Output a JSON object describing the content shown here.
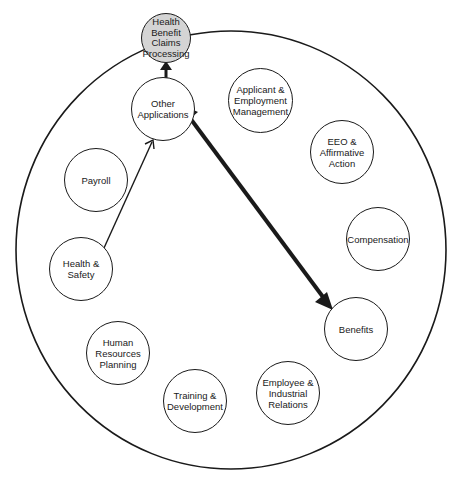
{
  "diagram": {
    "type": "system-integration-circle",
    "colors": {
      "line": "#1a1a1a",
      "hub_fill": "#d4d4d4",
      "background": "#ffffff"
    },
    "hub": {
      "id": "hbcp",
      "label": "Health\nBenefit\nClaims\nProcessing"
    },
    "nodes": [
      {
        "id": "other",
        "label": "Other\nApplications"
      },
      {
        "id": "applicant",
        "label": "Applicant &\nEmployment\nManagement"
      },
      {
        "id": "eeo",
        "label": "EEO &\nAffirmative\nAction"
      },
      {
        "id": "compensation",
        "label": "Compensation"
      },
      {
        "id": "benefits",
        "label": "Benefits"
      },
      {
        "id": "employee",
        "label": "Employee &\nIndustrial\nRelations"
      },
      {
        "id": "training",
        "label": "Training &\nDevelopment"
      },
      {
        "id": "hrp",
        "label": "Human\nResources\nPlanning"
      },
      {
        "id": "health",
        "label": "Health &\nSafety"
      },
      {
        "id": "payroll",
        "label": "Payroll"
      }
    ],
    "edges": [
      {
        "from": "other",
        "to": "hbcp",
        "style": "thick-arrow"
      },
      {
        "from": "health",
        "to": "other",
        "style": "thin-arrow"
      },
      {
        "from": "other",
        "to": "benefits",
        "style": "thick-double-arrow"
      }
    ]
  }
}
